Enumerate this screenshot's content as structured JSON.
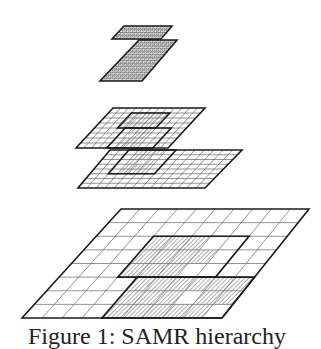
{
  "figure": {
    "caption": "Figure 1: SAMR hierarchy",
    "colors": {
      "line": "#1a1a1a",
      "thin": "#555555",
      "hatch": "#777777",
      "background": "#ffffff"
    }
  },
  "levels": [
    {
      "name": "level-0-base",
      "cols": 10,
      "rows": 8,
      "corners": {
        "tl": [
          121,
          209
        ],
        "tr": [
          309,
          209
        ],
        "bl": [
          22,
          318
        ],
        "br": [
          222,
          318
        ]
      },
      "patches": [
        {
          "c0": 3,
          "c1": 8,
          "r0": 2,
          "r1": 5,
          "shaded": [
            [
              2,
              3
            ],
            [
              2,
              4
            ],
            [
              2,
              5
            ],
            [
              3,
              3
            ],
            [
              3,
              4
            ],
            [
              3,
              5
            ],
            [
              3,
              6
            ],
            [
              4,
              3
            ],
            [
              4,
              4
            ],
            [
              4,
              5
            ]
          ]
        },
        {
          "c0": 4,
          "c1": 10,
          "r0": 5,
          "r1": 8,
          "shaded": [
            [
              5,
              4
            ],
            [
              5,
              5
            ],
            [
              5,
              6
            ],
            [
              5,
              7
            ],
            [
              5,
              8
            ],
            [
              5,
              9
            ],
            [
              6,
              4
            ],
            [
              6,
              5
            ],
            [
              6,
              6
            ],
            [
              6,
              8
            ],
            [
              6,
              9
            ],
            [
              7,
              4
            ],
            [
              7,
              5
            ],
            [
              7,
              6
            ],
            [
              7,
              7
            ],
            [
              7,
              8
            ]
          ]
        }
      ]
    },
    {
      "name": "level-1-lower",
      "cols": 14,
      "rows": 8,
      "corners": {
        "tl": [
          110,
          150
        ],
        "tr": [
          242,
          150
        ],
        "bl": [
          78,
          188
        ],
        "br": [
          205,
          188
        ]
      },
      "patches": [
        {
          "c0": 2,
          "c1": 7,
          "r0": 0,
          "r1": 5,
          "shaded": [
            [
              0,
              3
            ],
            [
              0,
              4
            ],
            [
              0,
              5
            ],
            [
              1,
              3
            ],
            [
              1,
              4
            ],
            [
              2,
              3
            ],
            [
              2,
              5
            ],
            [
              3,
              3
            ],
            [
              3,
              4
            ],
            [
              3,
              5
            ],
            [
              4,
              3
            ],
            [
              4,
              4
            ],
            [
              4,
              5
            ]
          ]
        }
      ]
    },
    {
      "name": "level-1-upper",
      "cols": 12,
      "rows": 8,
      "corners": {
        "tl": [
          113,
          108
        ],
        "tr": [
          205,
          108
        ],
        "bl": [
          76,
          148
        ],
        "br": [
          168,
          148
        ]
      },
      "patches": [
        {
          "c0": 3,
          "c1": 8,
          "r0": 1,
          "r1": 4,
          "shaded": [
            [
              1,
              3
            ],
            [
              1,
              4
            ],
            [
              1,
              5
            ],
            [
              1,
              6
            ],
            [
              1,
              7
            ],
            [
              2,
              3
            ],
            [
              2,
              4
            ],
            [
              2,
              5
            ],
            [
              2,
              6
            ],
            [
              2,
              7
            ],
            [
              3,
              3
            ],
            [
              3,
              4
            ],
            [
              3,
              5
            ],
            [
              3,
              6
            ],
            [
              3,
              7
            ]
          ]
        },
        {
          "c0": 4,
          "c1": 10,
          "r0": 4,
          "r1": 8,
          "shaded": [
            [
              4,
              5
            ],
            [
              4,
              6
            ],
            [
              4,
              7
            ],
            [
              5,
              6
            ],
            [
              5,
              7
            ],
            [
              6,
              5
            ],
            [
              6,
              6
            ],
            [
              6,
              7
            ],
            [
              7,
              5
            ],
            [
              7,
              6
            ],
            [
              7,
              7
            ]
          ]
        }
      ]
    },
    {
      "name": "level-2-lower",
      "cols": 10,
      "rows": 14,
      "corners": {
        "tl": [
          139,
          40
        ],
        "tr": [
          177,
          40
        ],
        "bl": [
          100,
          81
        ],
        "br": [
          142,
          81
        ]
      },
      "patches": [],
      "fill_all": true
    },
    {
      "name": "level-2-upper",
      "cols": 14,
      "rows": 4,
      "corners": {
        "tl": [
          124,
          26
        ],
        "tr": [
          172,
          26
        ],
        "bl": [
          112,
          39
        ],
        "br": [
          161,
          39
        ]
      },
      "patches": [],
      "fill_all": true
    }
  ]
}
